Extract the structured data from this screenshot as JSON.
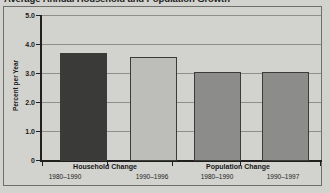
{
  "title": "Average Annual Household and Population Growth",
  "chart_data": {
    "type": "bar",
    "title": "Average Annual Household and Population Growth",
    "xlabel": "",
    "ylabel": "Percent per Year",
    "ylim": [
      0,
      5.0
    ],
    "yticks": [
      "0",
      "1.0",
      "2.0",
      "3.0",
      "4.0",
      "5.0"
    ],
    "ytick_values": [
      0,
      1.0,
      2.0,
      3.0,
      4.0,
      5.0
    ],
    "grid": true,
    "legend": "none",
    "groups": [
      {
        "label": "Household Change",
        "bars": [
          {
            "category": "1980–1990",
            "value": 3.7,
            "color": "#3a3a38"
          },
          {
            "category": "1990–1996",
            "value": 3.55,
            "color": "#bdbdba"
          }
        ]
      },
      {
        "label": "Population Change",
        "bars": [
          {
            "category": "1980–1990",
            "value": 3.05,
            "color": "#8c8c8a"
          },
          {
            "category": "1990–1997",
            "value": 3.05,
            "color": "#8c8c8a"
          }
        ]
      }
    ],
    "categories": [
      "1980–1990",
      "1990–1996",
      "1980–1990",
      "1990–1997"
    ],
    "values": [
      3.7,
      3.55,
      3.05,
      3.05
    ],
    "bar_colors": [
      "#3a3a38",
      "#bdbdba",
      "#8c8c8a",
      "#8c8c8a"
    ]
  },
  "axis": {
    "y_title": "Percent per Year",
    "tick_0": "0",
    "tick_1": "1.0",
    "tick_2": "2.0",
    "tick_3": "3.0",
    "tick_4": "4.0",
    "tick_5": "5.0"
  },
  "xlabels": {
    "group_0": "Household Change",
    "group_1": "Population Change",
    "year_0": "1980–1990",
    "year_1": "1990–1996",
    "year_2": "1980–1990",
    "year_3": "1990–1997"
  },
  "colors": {
    "background": "#d2d2ce",
    "frame": "#6e6e6a",
    "axis": "#22201f",
    "grid": "#8e8e8a",
    "bar_dark": "#3a3a38",
    "bar_light": "#bdbdba",
    "bar_medium": "#8c8c8a",
    "text": "#1b1b1b"
  }
}
